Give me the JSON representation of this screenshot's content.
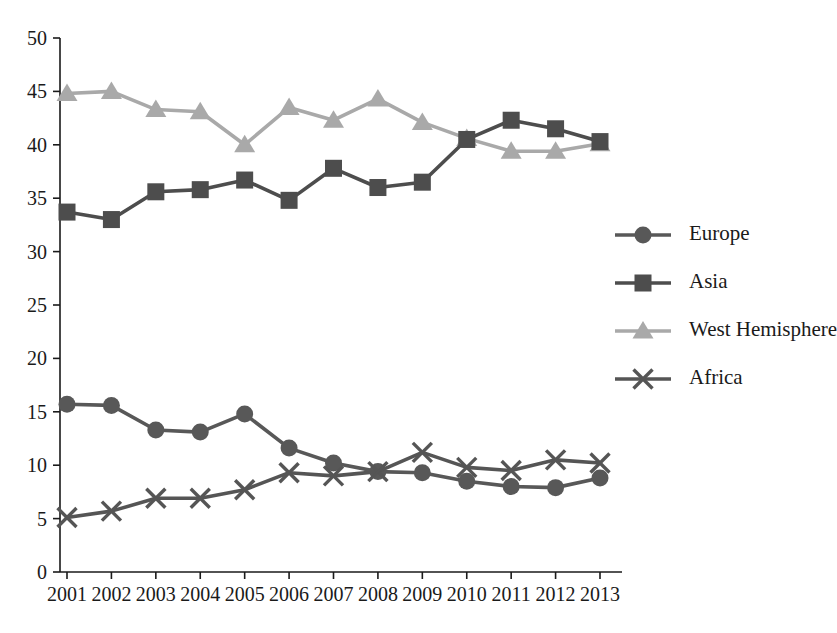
{
  "chart_data": {
    "type": "line",
    "title": "",
    "xlabel": "",
    "ylabel": "",
    "grid": false,
    "legend_position": "right-middle",
    "categories": [
      "2001",
      "2002",
      "2003",
      "2004",
      "2005",
      "2006",
      "2007",
      "2008",
      "2009",
      "2010",
      "2011",
      "2012",
      "2013"
    ],
    "x": [
      2001,
      2002,
      2003,
      2004,
      2005,
      2006,
      2007,
      2008,
      2009,
      2010,
      2011,
      2012,
      2013
    ],
    "xlim": [
      2001,
      2013
    ],
    "ylim": [
      0,
      50
    ],
    "y_ticks": [
      0,
      5,
      10,
      15,
      20,
      25,
      30,
      35,
      40,
      45,
      50
    ],
    "x_ticks": [
      "2001",
      "2002",
      "2003",
      "2004",
      "2005",
      "2006",
      "2007",
      "2008",
      "2009",
      "2010",
      "2011",
      "2012",
      "2013"
    ],
    "series": [
      {
        "name": "Europe",
        "marker": "circle",
        "color": "#585858",
        "values": [
          15.7,
          15.6,
          13.3,
          13.1,
          14.8,
          11.6,
          10.2,
          9.4,
          9.3,
          8.5,
          8.0,
          7.9,
          8.8
        ]
      },
      {
        "name": "Asia",
        "marker": "square",
        "color": "#4d4d4d",
        "values": [
          33.7,
          33.0,
          35.6,
          35.8,
          36.7,
          34.8,
          37.8,
          36.0,
          36.5,
          40.5,
          42.3,
          41.5,
          40.3
        ]
      },
      {
        "name": "West Hemisphere",
        "marker": "triangle",
        "color": "#a9a9a9",
        "values": [
          44.8,
          45.0,
          43.3,
          43.1,
          40.0,
          43.5,
          42.3,
          44.3,
          42.1,
          40.6,
          39.4,
          39.4,
          40.1
        ]
      },
      {
        "name": "Africa",
        "marker": "cross",
        "color": "#555555",
        "values": [
          5.1,
          5.7,
          6.9,
          6.9,
          7.7,
          9.3,
          9.0,
          9.4,
          11.2,
          9.8,
          9.5,
          10.5,
          10.2
        ]
      }
    ]
  },
  "legend": {
    "items": [
      {
        "label": "Europe"
      },
      {
        "label": "Asia"
      },
      {
        "label": "West Hemisphere"
      },
      {
        "label": "Africa"
      }
    ]
  },
  "axes": {
    "y_tick_labels": [
      "50",
      "45",
      "40",
      "35",
      "30",
      "25",
      "20",
      "15",
      "10",
      "5",
      "0"
    ],
    "x_tick_labels": [
      "2001",
      "2002",
      "2003",
      "2004",
      "2005",
      "2006",
      "2007",
      "2008",
      "2009",
      "2010",
      "2011",
      "2012",
      "2013"
    ]
  }
}
